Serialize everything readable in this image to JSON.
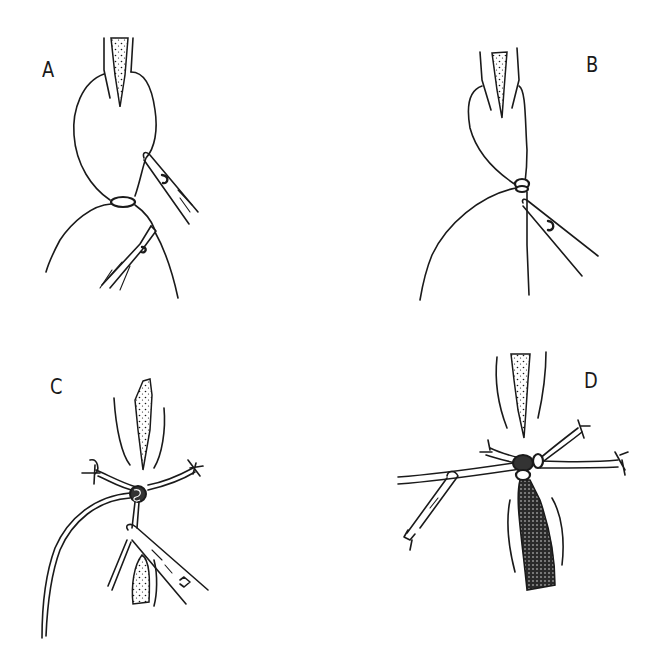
{
  "figure": {
    "panels": [
      {
        "id": "A",
        "label": "A",
        "elements": [
          "vessel-stump",
          "suture-loop",
          "knot",
          "needle-holder",
          "forceps"
        ]
      },
      {
        "id": "B",
        "label": "B",
        "elements": [
          "vessel-stump",
          "suture-loop",
          "knot",
          "needle-holder",
          "suture-tail"
        ]
      },
      {
        "id": "C",
        "label": "C",
        "elements": [
          "tissue-upper",
          "tissue-lower",
          "knot",
          "suture-ends",
          "needle-holder",
          "long-suture"
        ]
      },
      {
        "id": "D",
        "label": "D",
        "elements": [
          "tissue-upper",
          "tissue-lower-dark",
          "knot",
          "suture-ends",
          "needle-holder"
        ]
      }
    ]
  },
  "colors": {
    "ink": "#1a1a1a",
    "background": "#ffffff"
  }
}
